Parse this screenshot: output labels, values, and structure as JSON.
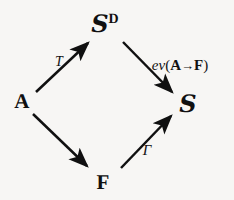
{
  "diagram": {
    "type": "commutative-diagram",
    "shape": "diamond",
    "background_color": "#f7f6f4",
    "ink_color": "#101010",
    "nodes": [
      {
        "id": "top",
        "label": "S",
        "superscript": "D",
        "style": "script-with-bold-superscript",
        "x": 105,
        "y": 24
      },
      {
        "id": "left",
        "label": "A",
        "superscript": "",
        "style": "bold-serif",
        "x": 22,
        "y": 101
      },
      {
        "id": "right",
        "label": "S",
        "superscript": "",
        "style": "script",
        "x": 188,
        "y": 104
      },
      {
        "id": "bottom",
        "label": "F",
        "superscript": "",
        "style": "bold-serif",
        "x": 103,
        "y": 182
      }
    ],
    "edges": [
      {
        "id": "a-to-sd",
        "from": "left",
        "to": "top",
        "label": "T",
        "label_kind": "italic",
        "label_x": 59,
        "label_y": 62
      },
      {
        "id": "sd-to-s",
        "from": "top",
        "to": "right",
        "label": "ev(A→F)",
        "label_kind": "ev",
        "label_x": 180,
        "label_y": 65
      },
      {
        "id": "a-to-f",
        "from": "left",
        "to": "bottom",
        "label": "",
        "label_kind": "none",
        "label_x": 0,
        "label_y": 0
      },
      {
        "id": "f-to-s",
        "from": "bottom",
        "to": "right",
        "label": "Γ",
        "label_kind": "italic",
        "label_x": 147,
        "label_y": 150
      }
    ],
    "ev_label_parts": {
      "prefix": "ev",
      "open_paren": "(",
      "source": "A",
      "arrow": "→",
      "target": "F",
      "close_paren": ")"
    }
  }
}
